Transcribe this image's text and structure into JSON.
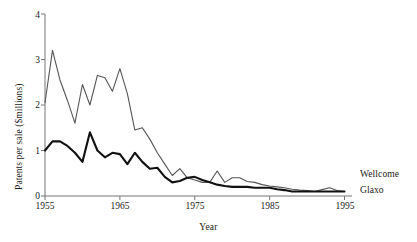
{
  "chart_data": {
    "type": "line",
    "title": "",
    "xlabel": "Year",
    "ylabel": "Patents per sale ($millions)",
    "xlim": [
      1955,
      1996
    ],
    "ylim": [
      0,
      4
    ],
    "xticks": [
      1955,
      1965,
      1975,
      1985,
      1995
    ],
    "xtick_labels": [
      "1955",
      "1965",
      "1975",
      "1985",
      "1995"
    ],
    "yticks": [
      0,
      1,
      2,
      3,
      4
    ],
    "ytick_labels": [
      "0",
      "1",
      "2",
      "3",
      "4"
    ],
    "grid": false,
    "legend_position": "right-inline",
    "x": [
      1955,
      1956,
      1957,
      1958,
      1959,
      1960,
      1961,
      1962,
      1963,
      1964,
      1965,
      1966,
      1967,
      1968,
      1969,
      1970,
      1971,
      1972,
      1973,
      1974,
      1975,
      1976,
      1977,
      1978,
      1979,
      1980,
      1981,
      1982,
      1983,
      1984,
      1985,
      1986,
      1987,
      1988,
      1989,
      1990,
      1991,
      1992,
      1993,
      1994,
      1995
    ],
    "series": [
      {
        "name": "Wellcome",
        "color": "#555555",
        "line_width": 1.1,
        "values": [
          2.05,
          3.2,
          2.55,
          2.1,
          1.6,
          2.45,
          2.0,
          2.65,
          2.6,
          2.3,
          2.8,
          2.25,
          1.45,
          1.5,
          1.25,
          0.95,
          0.7,
          0.45,
          0.6,
          0.4,
          0.35,
          0.3,
          0.3,
          0.55,
          0.3,
          0.4,
          0.4,
          0.32,
          0.3,
          0.25,
          0.22,
          0.2,
          0.18,
          0.15,
          0.13,
          0.12,
          0.1,
          0.14,
          0.18,
          0.12,
          0.1
        ]
      },
      {
        "name": "Glaxo",
        "color": "#111111",
        "line_width": 2.1,
        "values": [
          1.0,
          1.2,
          1.2,
          1.1,
          0.95,
          0.75,
          1.4,
          1.0,
          0.85,
          0.95,
          0.92,
          0.7,
          0.95,
          0.75,
          0.6,
          0.62,
          0.42,
          0.3,
          0.33,
          0.4,
          0.42,
          0.35,
          0.3,
          0.25,
          0.22,
          0.2,
          0.2,
          0.2,
          0.18,
          0.18,
          0.18,
          0.15,
          0.13,
          0.1,
          0.1,
          0.1,
          0.1,
          0.1,
          0.1,
          0.1,
          0.1
        ]
      }
    ],
    "series_labels": [
      "Wellcome",
      "Glaxo"
    ]
  },
  "axes": {
    "y_title": "Patents per sale ($millions)",
    "x_title": "Year"
  },
  "labels": {
    "wellcome": "Wellcome",
    "glaxo": "Glaxo"
  }
}
